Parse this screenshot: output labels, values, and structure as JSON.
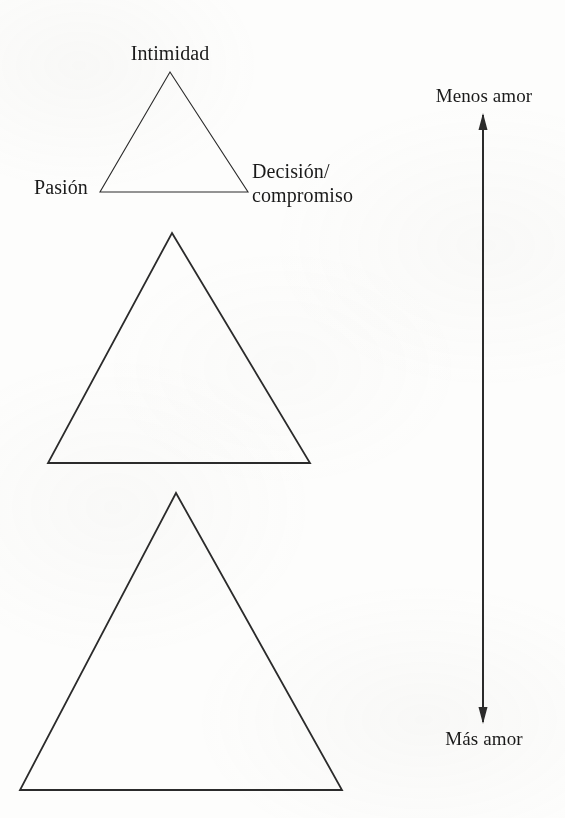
{
  "figure": {
    "background_color": "#fdfdfc",
    "ink_color": "#2b2b2b",
    "width": 565,
    "height": 818,
    "triangles": [
      {
        "id": "small",
        "name": "triangulo-pequeno",
        "apex": [
          170,
          72
        ],
        "base_left": [
          100,
          192
        ],
        "base_right": [
          248,
          192
        ],
        "stroke_width": 1.1
      },
      {
        "id": "medium",
        "name": "triangulo-mediano",
        "apex": [
          172,
          233
        ],
        "base_left": [
          48,
          463
        ],
        "base_right": [
          310,
          463
        ],
        "stroke_width": 1.8
      },
      {
        "id": "large",
        "name": "triangulo-grande",
        "apex": [
          176,
          493
        ],
        "base_left": [
          20,
          790
        ],
        "base_right": [
          342,
          790
        ],
        "stroke_width": 1.8
      }
    ],
    "vertex_labels": {
      "top": "Intimidad",
      "left": "Pasión",
      "right_line1": "Decisión/",
      "right_line2": "compromiso"
    },
    "scale_arrow": {
      "name": "flecha-escala-amor",
      "x": 483,
      "y_top": 115,
      "y_bottom": 722,
      "shaft_width": 2,
      "head_width": 9,
      "head_length": 17,
      "double_headed": true,
      "top_label": "Menos amor",
      "bottom_label": "Más amor"
    }
  }
}
